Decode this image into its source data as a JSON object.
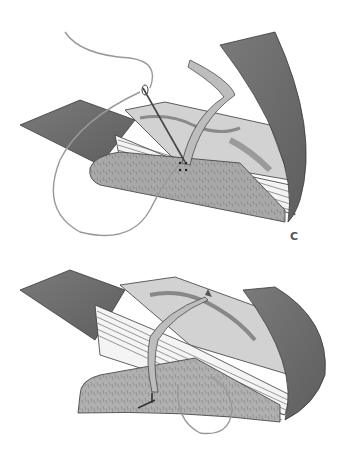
{
  "figure": {
    "steps": [
      {
        "label": "C",
        "depicts": "needle and thread passing through the front flap near a leather tie strap"
      },
      {
        "label": "D",
        "depicts": "thread looped around the flap with tie strap wrapped over the book, stitch finished"
      }
    ]
  },
  "colors": {
    "background": "#ffffff",
    "leather_dark": "#6e6e6e",
    "leather_mid": "#8c8c8c",
    "flap_textured": "#a9a9a9",
    "marbled_light": "#d2d2d2",
    "pages": "#f4f4f4",
    "outline": "#3a3a3a",
    "thread": "#c8c8c8"
  }
}
